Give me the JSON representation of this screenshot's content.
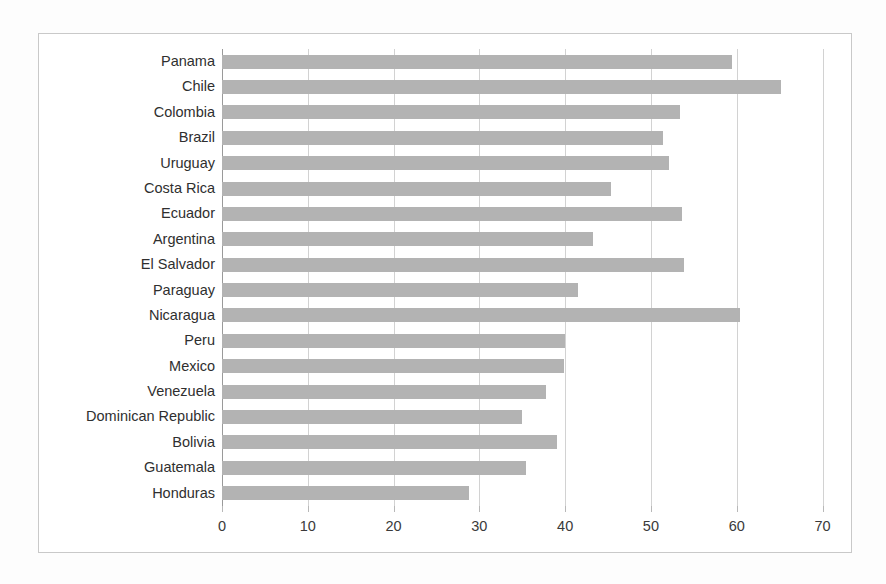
{
  "chart_data": {
    "type": "bar",
    "orientation": "horizontal",
    "title": "",
    "subtitle": "",
    "xlabel": "",
    "ylabel": "",
    "xlim": [
      0,
      70
    ],
    "ylim": null,
    "xticks": [
      0,
      10,
      20,
      30,
      40,
      50,
      60,
      70
    ],
    "xtick_labels": [
      "0",
      "10",
      "20",
      "30",
      "40",
      "50",
      "60",
      "70"
    ],
    "grid": "vertical",
    "legend": null,
    "legend_position": "none",
    "annotations": [],
    "series_color": "#b3b3b3",
    "categories": [
      "Panama",
      "Chile",
      "Colombia",
      "Brazil",
      "Uruguay",
      "Costa Rica",
      "Ecuador",
      "Argentina",
      "El Salvador",
      "Paraguay",
      "Nicaragua",
      "Peru",
      "Mexico",
      "Venezuela",
      "Dominican Republic",
      "Bolivia",
      "Guatemala",
      "Honduras"
    ],
    "values": [
      59.5,
      65.2,
      53.4,
      51.4,
      52.1,
      45.3,
      53.6,
      43.3,
      53.8,
      41.5,
      60.4,
      40.0,
      39.9,
      37.8,
      35.0,
      39.0,
      35.4,
      28.8
    ]
  }
}
